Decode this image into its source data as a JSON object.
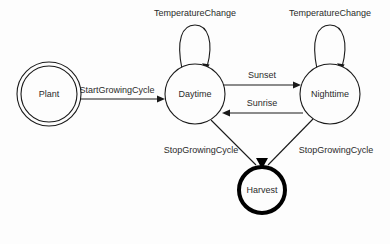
{
  "diagram": {
    "type": "state-machine-diagram",
    "background_color": "#fdfdfd",
    "line_color": "#1a1a1a",
    "text_color": "#2b2b2b",
    "final_state_color": "#000000",
    "states": [
      {
        "id": "plant",
        "label": "Plant",
        "shape": "double-circle",
        "kind": "initial",
        "cx": 49,
        "cy": 94,
        "r_outer": 32,
        "r_inner": 28
      },
      {
        "id": "daytime",
        "label": "Daytime",
        "shape": "circle",
        "kind": "normal",
        "cx": 195,
        "cy": 94,
        "r_outer": 30,
        "r_inner": 0
      },
      {
        "id": "nighttime",
        "label": "Nighttime",
        "shape": "circle",
        "kind": "normal",
        "cx": 330,
        "cy": 94,
        "r_outer": 30,
        "r_inner": 0
      },
      {
        "id": "harvest",
        "label": "Harvest",
        "shape": "thick-circle",
        "kind": "final",
        "cx": 262,
        "cy": 190,
        "r_outer": 24,
        "r_inner": 0
      }
    ],
    "transitions": [
      {
        "id": "t-start",
        "label": "StartGrowingCycle",
        "from": "plant",
        "to": "daytime",
        "kind": "straight",
        "label_x": 117,
        "label_y": 91
      },
      {
        "id": "t-temp-day",
        "label": "TemperatureChange",
        "from": "daytime",
        "to": "daytime",
        "kind": "self-loop",
        "label_x": 195,
        "label_y": 14
      },
      {
        "id": "t-temp-night",
        "label": "TemperatureChange",
        "from": "nighttime",
        "to": "nighttime",
        "kind": "self-loop",
        "label_x": 330,
        "label_y": 14
      },
      {
        "id": "t-sunset",
        "label": "Sunset",
        "from": "daytime",
        "to": "nighttime",
        "kind": "straight",
        "label_x": 262,
        "label_y": 76
      },
      {
        "id": "t-sunrise",
        "label": "Sunrise",
        "from": "nighttime",
        "to": "daytime",
        "kind": "straight",
        "label_x": 262,
        "label_y": 104
      },
      {
        "id": "t-stop-day",
        "label": "StopGrowingCycle",
        "from": "daytime",
        "to": "harvest",
        "kind": "diagonal",
        "label_x": 201,
        "label_y": 151
      },
      {
        "id": "t-stop-night",
        "label": "StopGrowingCycle",
        "from": "nighttime",
        "to": "harvest",
        "kind": "diagonal",
        "label_x": 336,
        "label_y": 151
      }
    ]
  }
}
